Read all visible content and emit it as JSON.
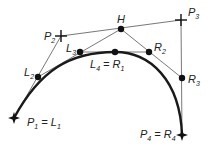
{
  "diagram": {
    "colors": {
      "curve": "#1a1a1a",
      "lines": "#555555",
      "points": "#111111",
      "background": "#ffffff"
    },
    "points": {
      "P1": {
        "x": 14,
        "y": 118,
        "marker": "star"
      },
      "P2": {
        "x": 61,
        "y": 36,
        "marker": "cross"
      },
      "P3": {
        "x": 181,
        "y": 20,
        "marker": "cross"
      },
      "P4": {
        "x": 182,
        "y": 135,
        "marker": "star"
      },
      "L2": {
        "x": 38,
        "y": 77,
        "marker": "dot"
      },
      "L3": {
        "x": 80,
        "y": 52,
        "marker": "dot"
      },
      "H": {
        "x": 121,
        "y": 29,
        "marker": "dot"
      },
      "R2": {
        "x": 149,
        "y": 52,
        "marker": "dot"
      },
      "R3": {
        "x": 182,
        "y": 78,
        "marker": "dot"
      },
      "L4R1": {
        "x": 115,
        "y": 52,
        "marker": "dot"
      }
    },
    "labels": {
      "P1": {
        "main": "P",
        "sub": "1",
        "eq": " = L",
        "eqsub": "1"
      },
      "P2": {
        "main": "P",
        "sub": "2"
      },
      "P3": {
        "main": "P",
        "sub": "3"
      },
      "P4": {
        "main": "P",
        "sub": "4",
        "eq": " = R",
        "eqsub": "4"
      },
      "L2": {
        "main": "L",
        "sub": "2"
      },
      "L3": {
        "main": "L",
        "sub": "3"
      },
      "H": {
        "main": "H"
      },
      "R2": {
        "main": "R",
        "sub": "2"
      },
      "R3": {
        "main": "R",
        "sub": "3"
      },
      "L4R1": {
        "main": "L",
        "sub": "4",
        "eq": " = R",
        "eqsub": "1"
      }
    }
  }
}
